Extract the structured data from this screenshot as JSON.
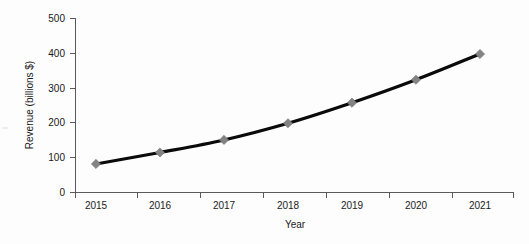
{
  "chart_data": {
    "type": "line",
    "title": "",
    "xlabel": "Year",
    "ylabel": "Revenue (billions $)",
    "categories": [
      "2015",
      "2016",
      "2017",
      "2018",
      "2019",
      "2020",
      "2021"
    ],
    "values": [
      82,
      115,
      151,
      199,
      258,
      324,
      398
    ],
    "ylim": [
      0,
      500
    ],
    "yticks": [
      0,
      100,
      200,
      300,
      400,
      500
    ],
    "ytick_labels": [
      "0",
      "100",
      "200",
      "300",
      "400",
      "500"
    ],
    "grid": false,
    "legend": null,
    "series_name": "Revenue",
    "line_color": "#0a0a0a",
    "marker_color": "#838383",
    "marker_shape": "diamond",
    "axis_color": "#5a5a5a",
    "background_color": "#fdfdfd"
  },
  "axes": {
    "y_title": "Revenue (billions $)",
    "x_title": "Year",
    "y_ticks": [
      {
        "label": "500",
        "value": 500
      },
      {
        "label": "400",
        "value": 400
      },
      {
        "label": "300",
        "value": 300
      },
      {
        "label": "200",
        "value": 200
      },
      {
        "label": "100",
        "value": 100
      },
      {
        "label": "0",
        "value": 0
      }
    ],
    "x_ticks": [
      {
        "label": "2015"
      },
      {
        "label": "2016"
      },
      {
        "label": "2017"
      },
      {
        "label": "2018"
      },
      {
        "label": "2019"
      },
      {
        "label": "2020"
      },
      {
        "label": "2021"
      }
    ]
  }
}
